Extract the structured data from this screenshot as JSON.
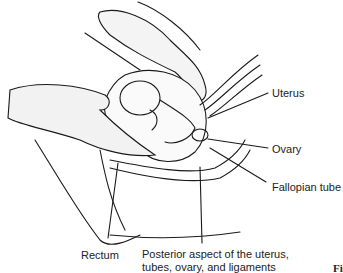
{
  "figure": {
    "labels": {
      "uterus": "Uterus",
      "ovary": "Ovary",
      "fallopian_tube": "Fallopian tube",
      "rectum": "Rectum",
      "posterior_line1": "Posterior aspect of the uterus,",
      "posterior_line2": "tubes, ovary, and ligaments"
    },
    "figure_label_fragment": "Fi"
  }
}
